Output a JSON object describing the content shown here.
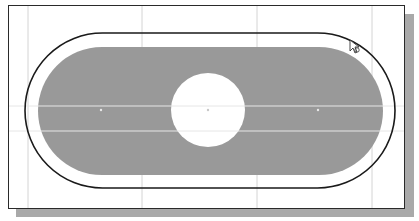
{
  "viewport": {
    "type": "sketch-canvas",
    "background": "#ffffff",
    "frame_color": "#2a2a2a",
    "shadow_color": "#a9a9a9"
  },
  "grid": {
    "color": "#d4d4d4",
    "vertical_lines_x": [
      28,
      142,
      257,
      372
    ],
    "horizontal_lines_y": [
      106,
      131
    ]
  },
  "sketch": {
    "outer_slot": {
      "x": 25,
      "y": 33,
      "width": 370,
      "height": 155,
      "stroke": "#1a1a1a",
      "fill": "none"
    },
    "inner_slot": {
      "x": 38,
      "y": 47,
      "width": 345,
      "height": 128,
      "fill": "#999999"
    },
    "hole": {
      "cx": 208,
      "cy": 110,
      "r": 37,
      "fill": "#ffffff"
    },
    "points": [
      {
        "x": 101,
        "y": 110
      },
      {
        "x": 208,
        "y": 110
      },
      {
        "x": 318,
        "y": 110
      }
    ]
  },
  "cursor": {
    "x": 350,
    "y": 40,
    "icon": "arrow-pointer-icon"
  }
}
